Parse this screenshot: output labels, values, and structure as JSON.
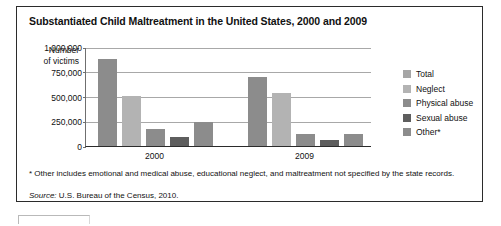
{
  "figure": {
    "title": "Substantiated Child Maltreatment in the United States, 2000 and 2009",
    "axis_title_line1": "Number",
    "axis_title_line2": "of victims",
    "footnote": "* Other includes emotional and medical abuse, educational neglect, and maltreatment not specified by the state records.",
    "source_label": "Source:",
    "source_text": "U.S. Bureau of the Census, 2010."
  },
  "chart_data": {
    "type": "bar",
    "title": "Substantiated Child Maltreatment in the United States, 2000 and 2009",
    "xlabel": "",
    "ylabel": "Number of victims",
    "categories": [
      "2000",
      "2009"
    ],
    "ylim": [
      0,
      1000000
    ],
    "yticks": [
      0,
      250000,
      500000,
      750000,
      1000000
    ],
    "ytick_labels": [
      "0",
      "250,000",
      "500,000",
      "750,000",
      "1,000,000"
    ],
    "grid": true,
    "legend_position": "right",
    "series": [
      {
        "name": "Total",
        "color": "#8c8c8c",
        "values": [
          880000,
          700000
        ]
      },
      {
        "name": "Neglect",
        "color": "#b3b3b3",
        "values": [
          510000,
          540000
        ]
      },
      {
        "name": "Physical abuse",
        "color": "#8c8c8c",
        "values": [
          170000,
          120000
        ]
      },
      {
        "name": "Sexual abuse",
        "color": "#5e5e5e",
        "values": [
          90000,
          65000
        ]
      },
      {
        "name": "Other*",
        "color": "#8c8c8c",
        "values": [
          240000,
          125000
        ]
      }
    ]
  },
  "legend": {
    "items": [
      {
        "label": "Total",
        "color": "#a6a6a6"
      },
      {
        "label": "Neglect",
        "color": "#b3b3b3"
      },
      {
        "label": "Physical abuse",
        "color": "#8c8c8c"
      },
      {
        "label": "Sexual abuse",
        "color": "#5e5e5e"
      },
      {
        "label": "Other*",
        "color": "#8c8c8c"
      }
    ]
  }
}
